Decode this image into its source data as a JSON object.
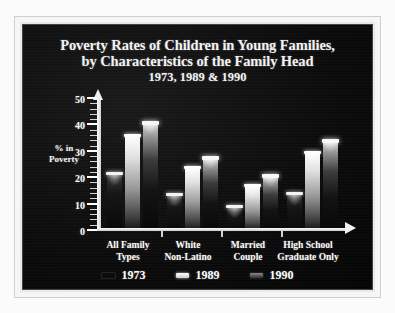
{
  "chart_data": {
    "type": "bar",
    "title": "Poverty Rates of Children in Young Families, by Characteristics of the Family Head",
    "title_line1": "Poverty Rates of Children in Young Families,",
    "title_line2": "by Characteristics of the Family Head",
    "subtitle": "1973, 1989 & 1990",
    "xlabel": "",
    "ylabel": "% in Poverty",
    "ylabel_line1": "% in",
    "ylabel_line2": "Poverty",
    "ylim": [
      0,
      50
    ],
    "ytick_values": [
      0,
      10,
      20,
      30,
      40,
      50
    ],
    "ytick_labels": [
      "0",
      "10",
      "20",
      "30",
      "40",
      "50"
    ],
    "grid": false,
    "legend_position": "bottom",
    "categories": [
      "All Family Types",
      "White Non-Latino",
      "Married Couple",
      "High School Graduate Only"
    ],
    "category_lines": [
      [
        "All Family",
        "Types"
      ],
      [
        "White",
        "Non-Latino"
      ],
      [
        "Married",
        "Couple"
      ],
      [
        "High School",
        "Graduate Only"
      ]
    ],
    "series": [
      {
        "name": "1973",
        "values": [
          21.5,
          13.5,
          9.0,
          14.0
        ],
        "color": "#0c0c0c"
      },
      {
        "name": "1989",
        "values": [
          36.0,
          24.0,
          17.0,
          29.5
        ],
        "color": "#e8e8e8"
      },
      {
        "name": "1990",
        "values": [
          41.0,
          27.5,
          21.0,
          34.0
        ],
        "color": "#6e6e6e"
      }
    ]
  },
  "figure": {
    "background_color": "#0a0a0a",
    "frame_color": "#e9e9e9",
    "text_color": "#fbfbfb"
  }
}
